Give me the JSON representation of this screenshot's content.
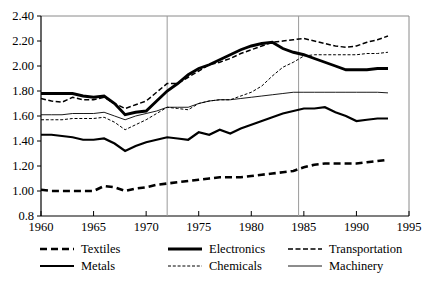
{
  "chart_data": {
    "type": "line",
    "title": "",
    "xlabel": "",
    "ylabel": "",
    "xlim": [
      1960,
      1995
    ],
    "ylim": [
      0.8,
      2.4
    ],
    "grid": false,
    "legend_position": "bottom",
    "x_ticks": [
      "1960",
      "1965",
      "1970",
      "1975",
      "1980",
      "1985",
      "1990",
      "1995"
    ],
    "x_tick_values": [
      1960,
      1965,
      1970,
      1975,
      1980,
      1985,
      1990,
      1995
    ],
    "y_ticks": [
      "0.8",
      "1.00",
      "1.20",
      "1.40",
      "1.60",
      "1.80",
      "2.00",
      "2.20",
      "2.40"
    ],
    "y_tick_values": [
      0.8,
      1.0,
      1.2,
      1.4,
      1.6,
      1.8,
      2.0,
      2.2,
      2.4
    ],
    "annotations": [
      {
        "type": "vertical-line",
        "x": 1972,
        "label": ""
      },
      {
        "type": "vertical-line",
        "x": 1984.5,
        "label": ""
      }
    ],
    "x": [
      1960,
      1961,
      1962,
      1963,
      1964,
      1965,
      1966,
      1967,
      1968,
      1969,
      1970,
      1971,
      1972,
      1973,
      1974,
      1975,
      1976,
      1977,
      1978,
      1979,
      1980,
      1981,
      1982,
      1983,
      1984,
      1985,
      1986,
      1987,
      1988,
      1989,
      1990,
      1991,
      1992,
      1993
    ],
    "series": [
      {
        "name": "Textiles",
        "style": "thick-dashed",
        "values": [
          1.01,
          1.0,
          1.0,
          1.0,
          1.0,
          1.0,
          1.04,
          1.03,
          1.0,
          1.02,
          1.03,
          1.05,
          1.06,
          1.07,
          1.08,
          1.09,
          1.1,
          1.11,
          1.11,
          1.11,
          1.12,
          1.13,
          1.14,
          1.15,
          1.16,
          1.19,
          1.21,
          1.22,
          1.22,
          1.22,
          1.22,
          1.23,
          1.24,
          1.25
        ]
      },
      {
        "name": "Electronics",
        "style": "extra-thick-solid",
        "values": [
          1.78,
          1.78,
          1.78,
          1.78,
          1.76,
          1.75,
          1.76,
          1.7,
          1.61,
          1.63,
          1.64,
          1.72,
          1.8,
          1.86,
          1.93,
          1.98,
          2.01,
          2.05,
          2.09,
          2.13,
          2.16,
          2.18,
          2.19,
          2.14,
          2.11,
          2.09,
          2.06,
          2.03,
          2.0,
          1.97,
          1.97,
          1.97,
          1.98,
          1.98
        ]
      },
      {
        "name": "Transportation",
        "style": "medium-dashed",
        "values": [
          1.74,
          1.72,
          1.71,
          1.75,
          1.73,
          1.73,
          1.75,
          1.7,
          1.66,
          1.69,
          1.72,
          1.79,
          1.86,
          1.86,
          1.91,
          1.96,
          2.01,
          2.03,
          2.06,
          2.1,
          2.13,
          2.16,
          2.19,
          2.2,
          2.21,
          2.22,
          2.2,
          2.18,
          2.16,
          2.15,
          2.16,
          2.19,
          2.21,
          2.24
        ]
      },
      {
        "name": "Metals",
        "style": "thick-solid",
        "values": [
          1.45,
          1.45,
          1.44,
          1.43,
          1.41,
          1.41,
          1.42,
          1.38,
          1.32,
          1.36,
          1.39,
          1.41,
          1.43,
          1.42,
          1.41,
          1.47,
          1.45,
          1.49,
          1.46,
          1.5,
          1.53,
          1.56,
          1.59,
          1.62,
          1.64,
          1.66,
          1.66,
          1.67,
          1.63,
          1.6,
          1.56,
          1.57,
          1.58,
          1.58
        ]
      },
      {
        "name": "Chemicals",
        "style": "thin-dotted",
        "values": [
          1.57,
          1.57,
          1.57,
          1.58,
          1.58,
          1.58,
          1.59,
          1.55,
          1.49,
          1.53,
          1.57,
          1.62,
          1.67,
          1.66,
          1.65,
          1.7,
          1.72,
          1.73,
          1.73,
          1.76,
          1.79,
          1.84,
          1.92,
          1.99,
          2.03,
          2.08,
          2.09,
          2.09,
          2.09,
          2.09,
          2.09,
          2.1,
          2.1,
          2.11
        ]
      },
      {
        "name": "Machinery",
        "style": "thin-solid",
        "values": [
          1.61,
          1.61,
          1.61,
          1.62,
          1.62,
          1.62,
          1.63,
          1.6,
          1.57,
          1.6,
          1.62,
          1.64,
          1.67,
          1.67,
          1.67,
          1.7,
          1.72,
          1.73,
          1.73,
          1.74,
          1.75,
          1.76,
          1.77,
          1.78,
          1.79,
          1.79,
          1.79,
          1.79,
          1.79,
          1.79,
          1.79,
          1.79,
          1.79,
          1.785
        ]
      }
    ],
    "legend": [
      {
        "label": "Textiles",
        "style": "thick-dashed",
        "row": 0,
        "col": 0
      },
      {
        "label": "Electronics",
        "style": "extra-thick-solid",
        "row": 0,
        "col": 1
      },
      {
        "label": "Transportation",
        "style": "medium-dashed",
        "row": 0,
        "col": 2
      },
      {
        "label": "Metals",
        "style": "thick-solid",
        "row": 1,
        "col": 0
      },
      {
        "label": "Chemicals",
        "style": "thin-dotted",
        "row": 1,
        "col": 1
      },
      {
        "label": "Machinery",
        "style": "thin-solid",
        "row": 1,
        "col": 2
      }
    ],
    "colors": {
      "line": "#000000",
      "frame": "#8a8a8a",
      "axis": "#000000",
      "reference_line": "#9a9a9a",
      "background": "#ffffff"
    }
  }
}
